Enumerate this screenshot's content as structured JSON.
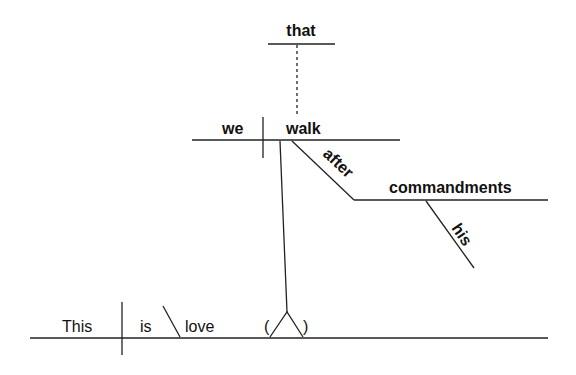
{
  "diagram": {
    "type": "Reed-Kellogg sentence diagram",
    "sentence": "This is love, that we walk after his commandments",
    "main_clause": {
      "subject": "This",
      "verb": "is",
      "predicate_nominative": "love",
      "appositive_placeholder_open": "(",
      "appositive_placeholder_close": ")"
    },
    "noun_clause": {
      "conjunction": "that",
      "subject": "we",
      "verb": "walk",
      "preposition": "after",
      "object_of_preposition": "commandments",
      "modifier": "his"
    }
  }
}
